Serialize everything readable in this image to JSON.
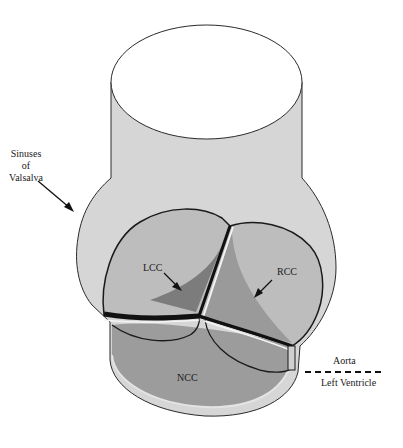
{
  "figure": {
    "type": "anatomical-diagram"
  },
  "labels": {
    "sinuses": [
      "Sinuses",
      "of",
      "Valsalva"
    ],
    "lcc": "LCC",
    "rcc": "RCC",
    "ncc": "NCC",
    "aorta": "Aorta",
    "left_ventricle": "Left Ventricle"
  },
  "colors": {
    "background": "#ffffff",
    "sinus_wall": "#d6d6d6",
    "cusp_light": "#bdbdbd",
    "cusp_ncc": "#9c9c9c",
    "cusp_shadow": "#7c7c7c",
    "outline": "#1a1a1a",
    "commissure_highlight": "#f4f4f4"
  }
}
